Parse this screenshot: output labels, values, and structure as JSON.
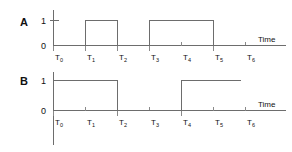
{
  "diagram": {
    "type": "digital-timing-diagram",
    "axis_label": "Time",
    "level_high": "1",
    "level_low": "0",
    "time_ticks": [
      {
        "base": "T",
        "sub": "0"
      },
      {
        "base": "T",
        "sub": "1"
      },
      {
        "base": "T",
        "sub": "2"
      },
      {
        "base": "T",
        "sub": "3"
      },
      {
        "base": "T",
        "sub": "4"
      },
      {
        "base": "T",
        "sub": "5"
      },
      {
        "base": "T",
        "sub": "6"
      }
    ],
    "signals": [
      {
        "name": "A",
        "level_high": "1",
        "level_low": "0",
        "axis_label": "Time",
        "states": [
          0,
          1,
          0,
          1,
          1,
          0,
          0
        ]
      },
      {
        "name": "B",
        "level_high": "1",
        "level_low": "0",
        "axis_label": "Time",
        "states": [
          1,
          1,
          0,
          0,
          1,
          1,
          1
        ]
      }
    ],
    "colors": {
      "line": "#6d6d6d",
      "text": "#111111",
      "background": "#ffffff"
    }
  }
}
